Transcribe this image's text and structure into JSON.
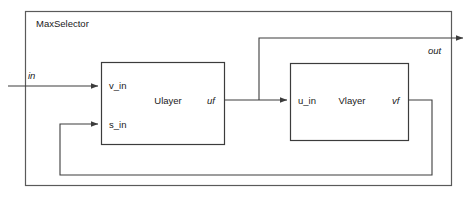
{
  "diagram": {
    "type": "block-diagram",
    "title": "MaxSelector",
    "outer_block": {
      "label": "MaxSelector",
      "x": 25,
      "y": 11,
      "width": 427,
      "height": 175
    },
    "blocks": [
      {
        "id": "ulayer",
        "label": "Ulayer",
        "x": 101,
        "y": 62,
        "width": 124,
        "height": 83,
        "input_ports": [
          {
            "name": "v_in",
            "label": "v_in",
            "y": 86
          },
          {
            "name": "s_in",
            "label": "s_in",
            "y": 124
          }
        ],
        "output_ports": [
          {
            "name": "uf",
            "label": "uf",
            "y": 100
          }
        ]
      },
      {
        "id": "vlayer",
        "label": "Vlayer",
        "x": 290,
        "y": 63,
        "width": 119,
        "height": 78,
        "input_ports": [
          {
            "name": "u_in",
            "label": "u_in",
            "y": 100
          }
        ],
        "output_ports": [
          {
            "name": "vf",
            "label": "vf",
            "y": 100
          }
        ]
      }
    ],
    "external_ports": [
      {
        "name": "in",
        "label": "in",
        "kind": "input",
        "x": 8,
        "y": 86
      },
      {
        "name": "out",
        "label": "out",
        "kind": "output",
        "x": 466,
        "y": 38
      }
    ],
    "connections": [
      {
        "from": "in",
        "to": "ulayer.v_in",
        "label": "in"
      },
      {
        "from": "ulayer.uf",
        "to": "vlayer.u_in",
        "label": "uf"
      },
      {
        "from": "ulayer.uf",
        "to": "out",
        "label": "out"
      },
      {
        "from": "vlayer.vf",
        "to": "ulayer.s_in",
        "label": "vf"
      }
    ],
    "colors": {
      "background": "#ffffff",
      "outer_stroke": "#5a5a5a",
      "block_stroke": "#3c3c3c",
      "wire_stroke": "#3c3c3c",
      "text": "#1a1a1a"
    }
  }
}
